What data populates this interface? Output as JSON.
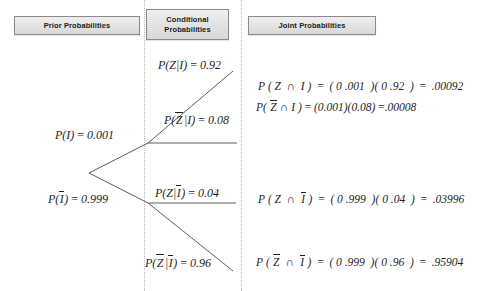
{
  "diagram": {
    "type": "probability-tree",
    "headers": {
      "prior": "Prior Probabilities",
      "conditional": "Conditional\nProbabilities",
      "conditional_line1": "Conditional",
      "conditional_line2": "Probabilities",
      "joint": "Joint Probabilities"
    },
    "prior_labels": {
      "top": {
        "text": "P(I) = 0.001",
        "event": "I",
        "value": 0.001
      },
      "bottom": {
        "text": "P(Ī) = 0.999",
        "event": "Ī",
        "value": 0.999
      }
    },
    "conditional_labels": {
      "z_given_i": {
        "text": "P(Z|I) = 0.92",
        "value": 0.92
      },
      "zbar_given_i": {
        "text": "P(Z̄|I) = 0.08",
        "value": 0.08
      },
      "z_given_ibar": {
        "text": "P(Z|Ī) = 0.04",
        "value": 0.04
      },
      "zbar_given_ibar": {
        "text": "P(Z̄|Ī) = 0.96",
        "value": 0.96
      }
    },
    "joint_equations": [
      {
        "id": "z-and-i",
        "text": "P ( Z ∩ I ) = ( 0 .001  )( 0 .92  ) =  .00092",
        "prior": 0.001,
        "conditional": 0.92,
        "result": 0.00092
      },
      {
        "id": "zbar-and-i",
        "text": "P( Z̄ ∩ I ) = (0.001)(0.08) =.00008",
        "prior": 0.001,
        "conditional": 0.08,
        "result": 8e-05
      },
      {
        "id": "z-and-ibar",
        "text": "P ( Z ∩ Ī ) = ( 0 .999  )( 0 .04  ) =  .03996",
        "prior": 0.999,
        "conditional": 0.04,
        "result": 0.03996
      },
      {
        "id": "zbar-and-ibar",
        "text": "P ( Z̄ ∩ Ī ) = ( 0 .999  )( 0 .96  ) =  .95904",
        "prior": 0.999,
        "conditional": 0.96,
        "result": 0.95904
      }
    ],
    "colors": {
      "header_border": "#8a8a8a",
      "header_fill": "#e4e4e4",
      "line": "#4a4a4a",
      "separator": "#b9b9b9",
      "text": "#1f1f1f"
    }
  }
}
